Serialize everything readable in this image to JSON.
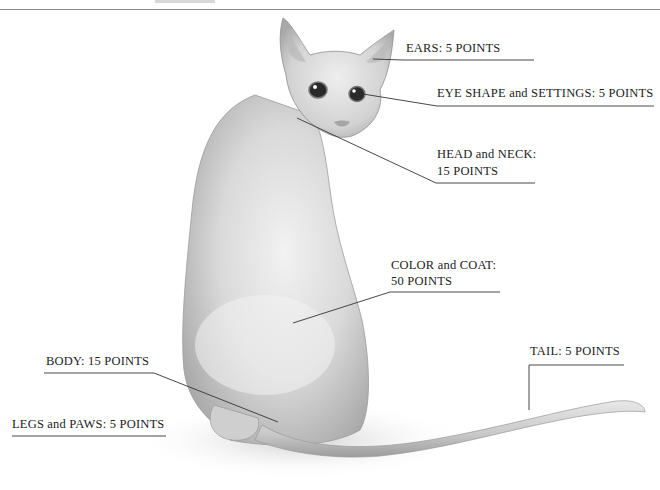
{
  "diagram": {
    "labels": {
      "ears": "EARS: 5 POINTS",
      "eyes": "EYE SHAPE and SETTINGS: 5 POINTS",
      "head_line1": "HEAD and NECK:",
      "head_line2": "15 POINTS",
      "color_line1": "COLOR and COAT:",
      "color_line2": "50 POINTS",
      "tail": "TAIL: 5 POINTS",
      "body": "BODY: 15 POINTS",
      "legs": "LEGS and PAWS: 5 POINTS"
    },
    "points": [
      {
        "part": "Ears",
        "points": 5
      },
      {
        "part": "Eye shape and settings",
        "points": 5
      },
      {
        "part": "Head and neck",
        "points": 15
      },
      {
        "part": "Color and coat",
        "points": 50
      },
      {
        "part": "Tail",
        "points": 5
      },
      {
        "part": "Body",
        "points": 15
      },
      {
        "part": "Legs and paws",
        "points": 5
      }
    ],
    "colors": {
      "fur_light": "#e6e6e6",
      "fur_mid": "#c4c4c4",
      "fur_dark": "#9a9a9a",
      "line": "#333333"
    }
  }
}
